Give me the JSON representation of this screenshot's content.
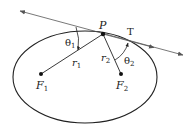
{
  "diagram": {
    "colors": {
      "ink": "#222222",
      "tangent": "#555555",
      "background": "#ffffff"
    },
    "ellipse": {
      "cx": 85,
      "cy": 77,
      "rx": 72,
      "ry": 46
    },
    "point_P": {
      "label": "P",
      "x": 103,
      "y": 34
    },
    "tangent": {
      "label": "T",
      "from": [
        20,
        11
      ],
      "to": [
        183,
        55
      ]
    },
    "foci": [
      {
        "label": "F",
        "sub": "1",
        "x": 41,
        "y": 74
      },
      {
        "label": "F",
        "sub": "2",
        "x": 121,
        "y": 74
      }
    ],
    "radii": [
      {
        "label": "r",
        "sub": "1"
      },
      {
        "label": "r",
        "sub": "2"
      }
    ],
    "angles": [
      {
        "label": "θ",
        "sub": "1"
      },
      {
        "label": "θ",
        "sub": "2"
      }
    ]
  }
}
